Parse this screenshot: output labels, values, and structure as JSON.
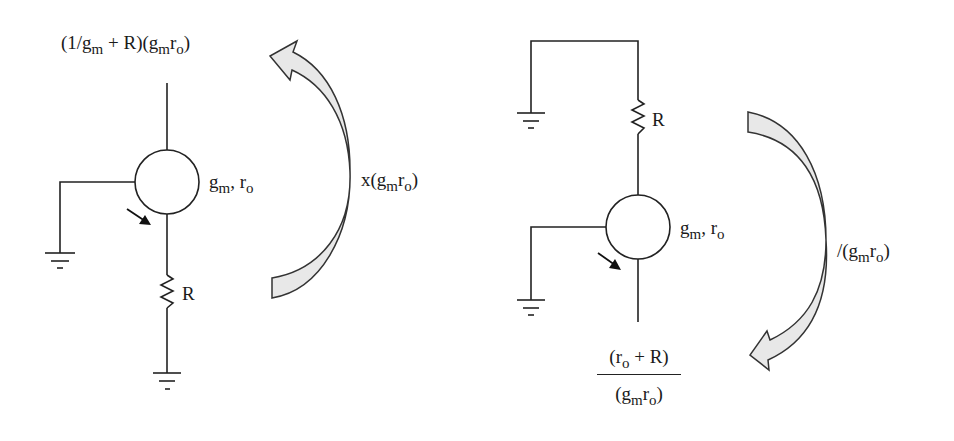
{
  "diagram": {
    "type": "circuit-impedance-transformation",
    "left_circuit": {
      "top_impedance": {
        "prefix": "(1/g",
        "prefix_sub": "m",
        "middle": " + R)(g",
        "middle_sub": "m",
        "r": "r",
        "r_sub": "o",
        "suffix": ")"
      },
      "device_label": {
        "g": "g",
        "g_sub": "m",
        "sep": ", r",
        "r_sub": "o"
      },
      "resistor_label": "R",
      "arrow_label": {
        "prefix": "x(g",
        "g_sub": "m",
        "r": "r",
        "r_sub": "o",
        "suffix": ")"
      },
      "arrow_direction": "up"
    },
    "right_circuit": {
      "device_label": {
        "g": "g",
        "g_sub": "m",
        "sep": ", r",
        "r_sub": "o"
      },
      "resistor_label": "R",
      "bottom_impedance": {
        "numerator": {
          "prefix": "(r",
          "r_sub": "o",
          "suffix": " + R)"
        },
        "denominator": {
          "prefix": "(g",
          "g_sub": "m",
          "r": "r",
          "r_sub": "o",
          "suffix": ")"
        }
      },
      "arrow_label": {
        "prefix": "/(g",
        "g_sub": "m",
        "r": "r",
        "r_sub": "o",
        "suffix": ")"
      },
      "arrow_direction": "down"
    },
    "colors": {
      "wire": "#222222",
      "arrow_fill": "#e8e8e8",
      "arrow_stroke": "#333333",
      "background": "#ffffff"
    }
  }
}
